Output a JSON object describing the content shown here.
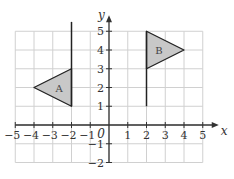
{
  "diagram": {
    "type": "coordinate-grid-transformation",
    "x_axis": {
      "label": "x",
      "min": -5,
      "max": 5,
      "ticks": [
        "−5",
        "−4",
        "−3",
        "−2",
        "−1",
        "1",
        "2",
        "3",
        "4",
        "5"
      ]
    },
    "y_axis": {
      "label": "y",
      "min": -2,
      "max": 5,
      "ticks": [
        "−2",
        "−1",
        "1",
        "2",
        "3",
        "4",
        "5"
      ]
    },
    "origin_label": "0",
    "colors": {
      "grid": "#d0d0d0",
      "axis": "#333333",
      "shape_fill": "#c8c8c8",
      "shape_stroke": "#222222"
    },
    "shapes": [
      {
        "name": "A",
        "label": "A",
        "pole": {
          "x": -2,
          "y_from": 1,
          "y_to": 5.5
        },
        "triangle": [
          [
            -2,
            3
          ],
          [
            -4,
            2
          ],
          [
            -2,
            1
          ]
        ]
      },
      {
        "name": "B",
        "label": "B",
        "pole": {
          "x": 2,
          "y_from": 1,
          "y_to": 5
        },
        "triangle": [
          [
            2,
            5
          ],
          [
            4,
            4
          ],
          [
            2,
            3
          ]
        ]
      }
    ]
  }
}
